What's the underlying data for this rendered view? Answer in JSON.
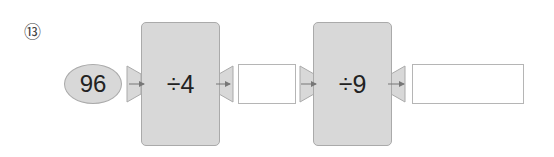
{
  "problem": {
    "number_label": "⑬",
    "start_value": "96",
    "steps": [
      {
        "operation": "÷4",
        "answer": ""
      },
      {
        "operation": "÷9",
        "answer": ""
      }
    ]
  },
  "colors": {
    "box_fill": "#d8d8d8",
    "box_border": "#aaaaaa",
    "arrow": "#777777"
  }
}
